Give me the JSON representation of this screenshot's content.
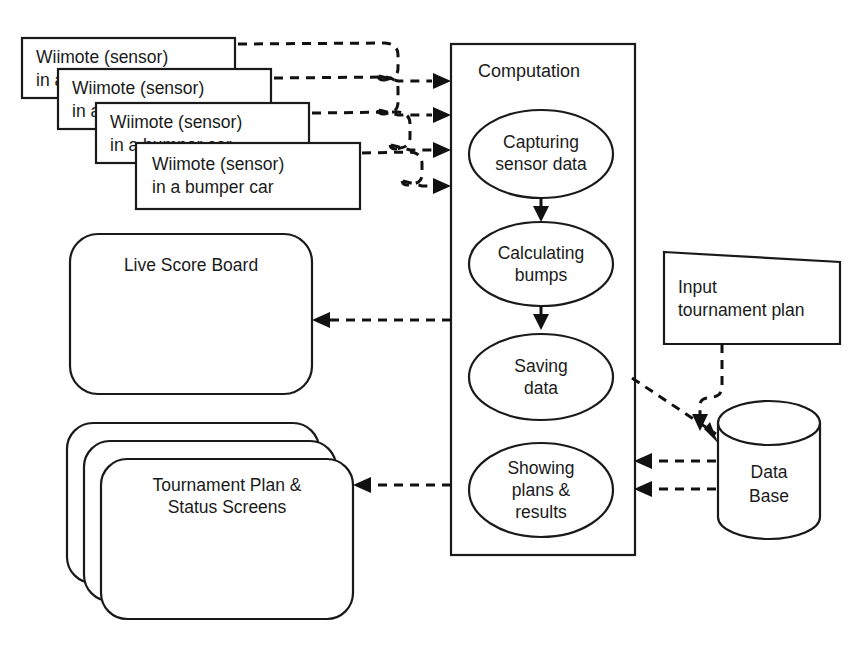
{
  "diagram": {
    "title_shown": false,
    "background_color": "#ffffff",
    "stroke_color": "#1a1a1a",
    "dash_color": "#111111",
    "sensor_boxes": {
      "name": "wiimote-sensor-stack",
      "count": 4,
      "items": [
        {
          "line1": "Wiimote (sensor)",
          "line2": "in a bumper car"
        },
        {
          "line1": "Wiimote (sensor)",
          "line2": "in a bumper car"
        },
        {
          "line1": "Wiimote (sensor)",
          "line2": "in a bumper car"
        },
        {
          "line1": "Wiimote (sensor)",
          "line2": "in a bumper car"
        }
      ]
    },
    "computation": {
      "title": "Computation",
      "steps": [
        {
          "id": "capturing",
          "line1": "Capturing",
          "line2": "sensor data",
          "line3": ""
        },
        {
          "id": "calculating",
          "line1": "Calculating",
          "line2": "bumps",
          "line3": ""
        },
        {
          "id": "saving",
          "line1": "Saving",
          "line2": "data",
          "line3": ""
        },
        {
          "id": "showing",
          "line1": "Showing",
          "line2": "plans &",
          "line3": "results"
        }
      ]
    },
    "live_score_board": {
      "label": "Live Score Board"
    },
    "tournament_screens": {
      "line1": "Tournament Plan &",
      "line2": "Status Screens",
      "count": 3
    },
    "input_tournament_plan": {
      "line1": "Input",
      "line2": "tournament plan"
    },
    "database": {
      "line1": "Data",
      "line2": "Base"
    },
    "connections": [
      {
        "from": "wiimote-1",
        "to": "computation",
        "style": "dashed-arrow"
      },
      {
        "from": "wiimote-2",
        "to": "computation",
        "style": "dashed-arrow"
      },
      {
        "from": "wiimote-3",
        "to": "computation",
        "style": "dashed-arrow"
      },
      {
        "from": "wiimote-4",
        "to": "computation",
        "style": "dashed-arrow"
      },
      {
        "from": "capturing",
        "to": "calculating",
        "style": "dashed-arrow"
      },
      {
        "from": "calculating",
        "to": "saving",
        "style": "dashed-arrow"
      },
      {
        "from": "computation",
        "to": "live-score-board",
        "style": "dashed-arrow"
      },
      {
        "from": "computation",
        "to": "tournament-screens",
        "style": "dashed-arrow"
      },
      {
        "from": "saving",
        "to": "database",
        "style": "dashed-arrow"
      },
      {
        "from": "input-tournament-plan",
        "to": "database",
        "style": "dashed-arrow"
      },
      {
        "from": "database",
        "to": "showing",
        "style": "dashed-arrow"
      },
      {
        "from": "database",
        "to": "showing",
        "style": "dashed-arrow"
      }
    ]
  }
}
